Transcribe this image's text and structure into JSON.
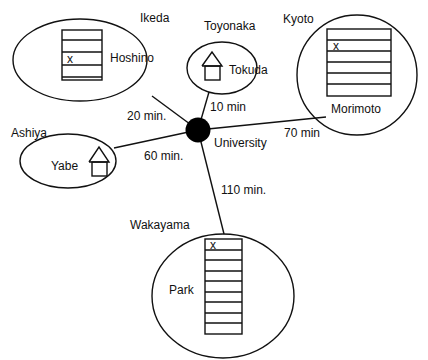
{
  "hub": {
    "label": "University"
  },
  "locations": [
    {
      "city": "Ikeda",
      "person": "Hoshino",
      "building": "apartment",
      "floors": 5,
      "marked_floor_from_top": 3,
      "mark": "x",
      "travel_time": "20 min."
    },
    {
      "city": "Toyonaka",
      "person": "Tokuda",
      "building": "house",
      "travel_time": "10 min"
    },
    {
      "city": "Kyoto",
      "person": "Morimoto",
      "building": "apartment",
      "floors": 6,
      "marked_floor_from_top": 2,
      "mark": "x",
      "travel_time": "70 min"
    },
    {
      "city": "Ashiya",
      "person": "Yabe",
      "building": "house",
      "travel_time": "60 min."
    },
    {
      "city": "Wakayama",
      "person": "Park",
      "building": "apartment",
      "floors": 9,
      "marked_floor_from_top": 1,
      "mark": "x",
      "travel_time": "110 min."
    }
  ],
  "colors": {
    "line": "#111111",
    "background": "#ffffff"
  }
}
